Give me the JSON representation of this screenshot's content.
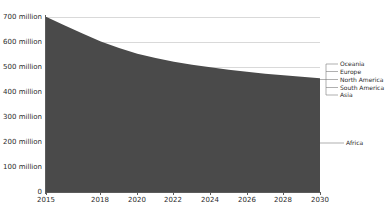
{
  "chart_data": {
    "type": "area",
    "title": "",
    "subtitle": "",
    "xlabel": "",
    "ylabel": "",
    "stacked": true,
    "grid": true,
    "legend_position": "right-callout",
    "xlim": [
      2015,
      2030
    ],
    "ylim": [
      0,
      700000000
    ],
    "y_tick_values": [
      0,
      100000000,
      200000000,
      300000000,
      400000000,
      500000000,
      600000000,
      700000000
    ],
    "y_tick_labels": [
      "0",
      "100 million",
      "200 million",
      "300 million",
      "400 million",
      "500 million",
      "600 million",
      "700 million"
    ],
    "x_tick_values": [
      2015,
      2018,
      2020,
      2022,
      2024,
      2026,
      2028,
      2030
    ],
    "x_tick_labels": [
      "2015",
      "2018",
      "2020",
      "2022",
      "2024",
      "2026",
      "2028",
      "2030"
    ],
    "x": [
      2015,
      2016,
      2017,
      2018,
      2019,
      2020,
      2021,
      2022,
      2023,
      2024,
      2025,
      2026,
      2027,
      2028,
      2029,
      2030
    ],
    "series": [
      {
        "name": "Africa",
        "color": "#4a4a4a",
        "values": [
          672000000,
          640000000,
          608000000,
          578000000,
          552000000,
          530000000,
          514000000,
          500000000,
          489000000,
          479000000,
          470000000,
          462000000,
          455000000,
          449000000,
          443000000,
          438000000
        ]
      },
      {
        "name": "Asia",
        "color": "#4f4f4f",
        "values": [
          17000000,
          16000000,
          15000000,
          14000000,
          13500000,
          13000000,
          12500000,
          12000000,
          11600000,
          11200000,
          10900000,
          10600000,
          10300000,
          10000000,
          9800000,
          9600000
        ]
      },
      {
        "name": "South America",
        "color": "#545454",
        "values": [
          6500000,
          6200000,
          5900000,
          5600000,
          5400000,
          5200000,
          5000000,
          4850000,
          4700000,
          4600000,
          4500000,
          4400000,
          4300000,
          4200000,
          4150000,
          4100000
        ]
      },
      {
        "name": "North America",
        "color": "#595959",
        "values": [
          3200000,
          3050000,
          2900000,
          2800000,
          2700000,
          2600000,
          2520000,
          2450000,
          2380000,
          2320000,
          2270000,
          2220000,
          2180000,
          2140000,
          2110000,
          2080000
        ]
      },
      {
        "name": "Europe",
        "color": "#5e5e5e",
        "values": [
          1800000,
          1720000,
          1650000,
          1580000,
          1520000,
          1470000,
          1420000,
          1380000,
          1340000,
          1310000,
          1280000,
          1255000,
          1230000,
          1210000,
          1190000,
          1175000
        ]
      },
      {
        "name": "Oceania",
        "color": "#636363",
        "values": [
          500000,
          480000,
          460000,
          445000,
          430000,
          415000,
          405000,
          395000,
          385000,
          377000,
          370000,
          363000,
          357000,
          352000,
          347000,
          343000
        ]
      }
    ],
    "totals": [
      701000000,
      667450000,
      633910000,
      602425000,
      575550000,
      552685000,
      535845000,
      521075000,
      509405000,
      498809000,
      489320000,
      480838000,
      473367000,
      466902000,
      460597000,
      455298000
    ],
    "callouts": [
      {
        "name": "oceania",
        "label": "Oceania"
      },
      {
        "name": "europe",
        "label": "Europe"
      },
      {
        "name": "north-america",
        "label": "North America"
      },
      {
        "name": "south-america",
        "label": "South America"
      },
      {
        "name": "asia",
        "label": "Asia"
      },
      {
        "name": "africa",
        "label": "Africa"
      }
    ],
    "colors": {
      "fill": "#4a4a4a",
      "grid": "#d9d9d9",
      "axis": "#5c5c5c",
      "text": "#2b2b2b",
      "background": "#ffffff"
    }
  }
}
